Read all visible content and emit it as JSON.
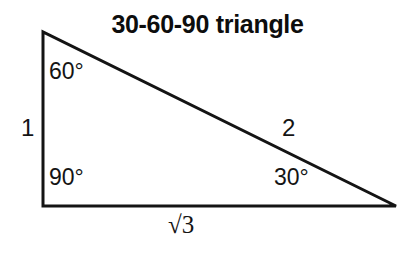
{
  "figure": {
    "title": "30-60-90 triangle",
    "colors": {
      "stroke": "#141414",
      "background": "#ffffff",
      "text": "#141414"
    },
    "labels": {
      "angle_at_apex": "60°",
      "angle_at_right_angle": "90°",
      "angle_at_far_vertex": "30°",
      "vertical_side": "1",
      "hypotenuse": "2",
      "horizontal_side": "√3"
    },
    "geometry": {
      "apex": [
        43,
        32
      ],
      "bottom_left": [
        43,
        206
      ],
      "bottom_right": [
        396,
        206
      ],
      "stroke_width": 3
    }
  }
}
